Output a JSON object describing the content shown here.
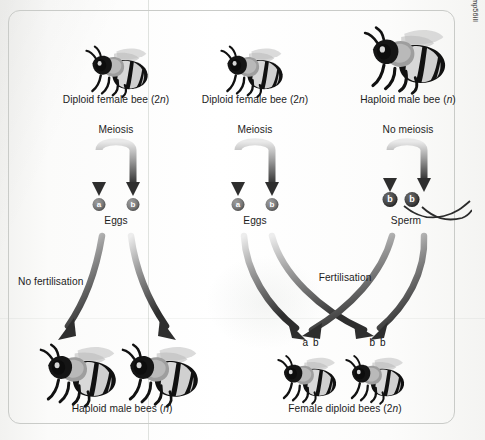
{
  "figure": {
    "attribution": "Adapted from https://www.topperlearning.com/answer/mechanism-for-sexual-determination-in-honey-bees/gmp56ill"
  },
  "columns": [
    {
      "id": "left",
      "parent_label": "Diploid female bee (2n)",
      "process_label": "Meiosis",
      "gamete_label": "Eggs",
      "gametes": [
        "a",
        "b"
      ],
      "fate_label": "No fertilisation",
      "offspring_label": "Haploid male bees (n)"
    },
    {
      "id": "middle",
      "parent_label": "Diploid female bee (2n)",
      "process_label": "Meiosis",
      "gamete_label": "Eggs",
      "gametes": [
        "a",
        "b"
      ],
      "fate_label": "Fertilisation",
      "offspring_label": "Female diploid bees (2n)"
    },
    {
      "id": "right",
      "parent_label": "Haploid male bee (n)",
      "process_label": "No meiosis",
      "gamete_label": "Sperm",
      "gametes": [
        "b",
        "b"
      ]
    }
  ],
  "offspring_genotypes": [
    "a b",
    "b b"
  ],
  "colors": {
    "panel_border": "#c9cbc8",
    "text": "#1d1d1d",
    "arrow_dark": "#3c3c3c",
    "arrow_light": "#e8e8e8",
    "egg_fill": "#6f6f6f",
    "sperm_fill": "#383838",
    "background": "#fbfbfa"
  }
}
